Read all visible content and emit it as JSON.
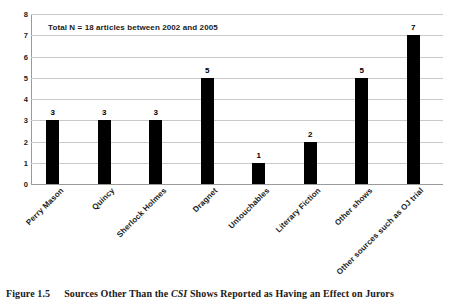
{
  "caption": {
    "number": "Figure 1.5",
    "text_before": "Sources Other Than the ",
    "emphasis": "CSI",
    "text_after": " Shows Reported as Having an Effect on Jurors"
  },
  "chart_data": {
    "type": "bar",
    "title": "",
    "annotation": "Total N = 18 articles between 2002 and 2005",
    "categories": [
      "Perry Mason",
      "Quincy",
      "Sherlock Holmes",
      "Dragnet",
      "Untouchables",
      "Literary Fiction",
      "Other shows",
      "Other sources such as OJ trial"
    ],
    "values": [
      3,
      3,
      3,
      5,
      1,
      2,
      5,
      7
    ],
    "data_labels": [
      "3",
      "3",
      "3",
      "5",
      "1",
      "2",
      "5",
      "7"
    ],
    "xlabel": "",
    "ylabel": "",
    "ylim": [
      0,
      8
    ],
    "yticks": [
      8,
      7,
      6,
      5,
      4,
      3,
      2,
      1,
      0
    ],
    "ytick_labels": [
      "8",
      "7",
      "6",
      "5",
      "4",
      "3",
      "2",
      "1",
      "0"
    ],
    "grid": true,
    "grid_axis": "y",
    "legend": false,
    "bar_color": "#000000",
    "grid_color": "#c9c9c9",
    "axis_color": "#9a9a9a",
    "background": "#ffffff"
  }
}
